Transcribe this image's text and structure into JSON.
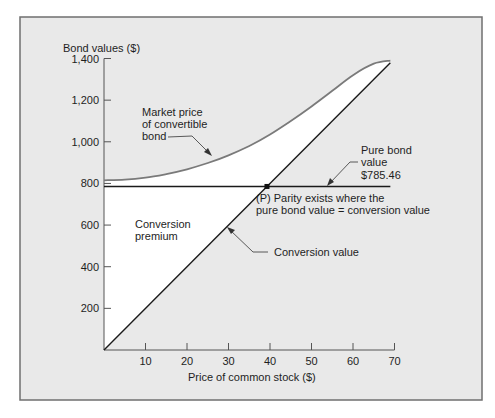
{
  "figure": {
    "frame_color": "#6f6f6f",
    "panel_bg": "#e9e9e9",
    "premium_fill": "#ffffff",
    "conversion_line_color": "#1a1a1a",
    "market_line_color": "#7a7a7a",
    "bond_line_color": "#1a1a1a"
  },
  "chart_data": {
    "type": "line",
    "title": "",
    "xlabel": "Price of common stock ($)",
    "ylabel": "Bond values ($)",
    "xlim": [
      0,
      70
    ],
    "ylim": [
      0,
      1400
    ],
    "x_ticks": [
      10,
      20,
      30,
      40,
      50,
      60,
      70
    ],
    "x_tick_labels": [
      "10",
      "20",
      "30",
      "40",
      "50",
      "60",
      "70"
    ],
    "y_ticks": [
      200,
      400,
      600,
      800,
      1000,
      1200,
      1400
    ],
    "y_tick_labels": [
      "200",
      "400",
      "600",
      "800",
      "1,000",
      "1,200",
      "1,400"
    ],
    "grid": false,
    "legend": null,
    "series": [
      {
        "name": "Conversion value",
        "x": [
          0,
          69
        ],
        "y": [
          0,
          1380
        ]
      },
      {
        "name": "Market price of convertible bond",
        "x": [
          0,
          5,
          10,
          15,
          20,
          25,
          30,
          35,
          40,
          45,
          50,
          55,
          60,
          65,
          69
        ],
        "y": [
          815,
          818,
          828,
          845,
          868,
          898,
          935,
          980,
          1035,
          1100,
          1170,
          1245,
          1320,
          1375,
          1390
        ]
      },
      {
        "name": "Pure bond value",
        "x": [
          0,
          69
        ],
        "y": [
          785.46,
          785.46
        ]
      }
    ],
    "parity_point": {
      "x": 39.27,
      "y": 785.46,
      "label": "P"
    },
    "annotations": [
      {
        "id": "market",
        "lines": [
          "Market price",
          "of convertible",
          "bond"
        ]
      },
      {
        "id": "pure_bond",
        "lines": [
          "Pure bond",
          "value",
          "$785.46"
        ]
      },
      {
        "id": "parity",
        "lines": [
          "(P) Parity exists where the",
          "pure bond value = conversion value"
        ]
      },
      {
        "id": "premium",
        "lines": [
          "Conversion",
          "premium"
        ]
      },
      {
        "id": "conversion",
        "lines": [
          "Conversion value"
        ]
      }
    ]
  }
}
